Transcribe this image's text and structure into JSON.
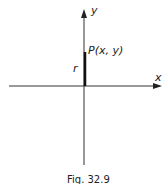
{
  "diagram": {
    "axes": {
      "x_label": "x",
      "y_label": "y"
    },
    "point": {
      "label": "P(x, y)"
    },
    "segment": {
      "label": "r"
    },
    "caption": "Fig. 32.9",
    "colors": {
      "ink": "#222222",
      "background": "#ffffff"
    }
  }
}
